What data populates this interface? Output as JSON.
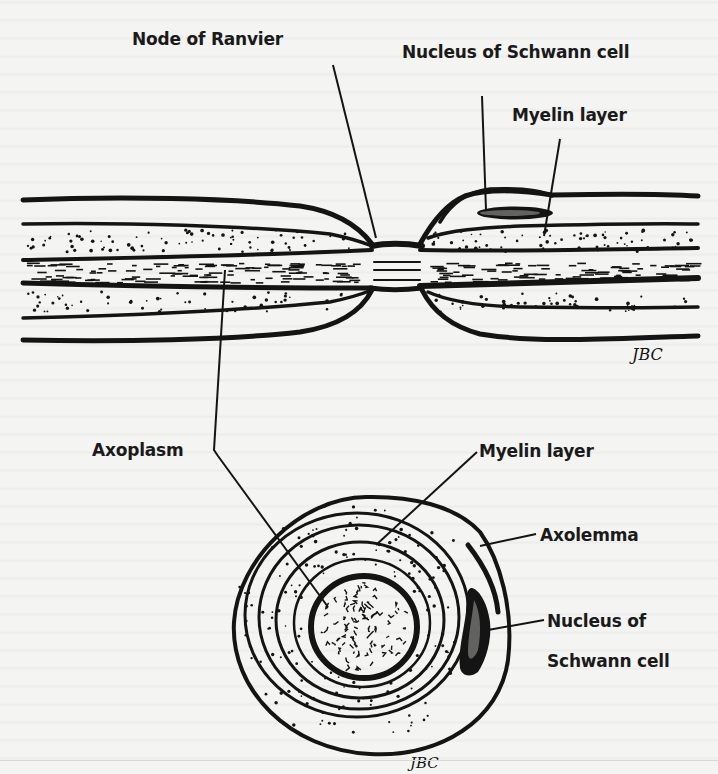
{
  "figure": {
    "longitudinal_section": {
      "labels": {
        "node_of_ranvier": "Node of Ranvier",
        "nucleus_of_schwann_cell": "Nucleus of Schwann cell",
        "myelin_layer": "Myelin layer"
      },
      "signature": "JBC"
    },
    "shared_labels": {
      "axoplasm": "Axoplasm"
    },
    "cross_section": {
      "labels": {
        "myelin_layer": "Myelin layer",
        "axolemma": "Axolemma",
        "nucleus_of_schwann_cell_line1": "Nucleus of",
        "nucleus_of_schwann_cell_line2": "Schwann cell"
      },
      "signature": "JBC"
    },
    "ink_color": "#141414",
    "paper_color": "#f4f4f2"
  }
}
